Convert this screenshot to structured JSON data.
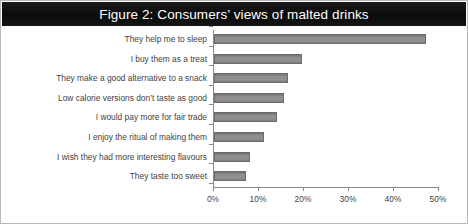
{
  "figure": {
    "title": "Figure 2: Consumers’ views of malted drinks",
    "border_color": "#b9b9b9",
    "title_band_color": "#101010",
    "title_text_color": "#ffffff"
  },
  "chart_data": {
    "type": "bar",
    "orientation": "horizontal",
    "title": "Figure 2: Consumers’ views of malted drinks",
    "xlabel": "",
    "ylabel": "",
    "xlim": [
      0,
      50
    ],
    "grid": false,
    "legend": false,
    "bar_color": "#878787",
    "bar_border_color": "#6b6b6b",
    "tick_label_format": "percent",
    "xticks": [
      0,
      10,
      20,
      30,
      40,
      50
    ],
    "xtick_labels": [
      "0%",
      "10%",
      "20%",
      "30%",
      "40%",
      "50%"
    ],
    "categories": [
      "They help me to sleep",
      "I buy them as a treat",
      "They make a good alternative to a snack",
      "Low calorie versions don’t taste as good",
      "I would pay more for fair trade",
      "I enjoy the ritual of making them",
      "I wish they had more interesting flavours",
      "They taste too sweet"
    ],
    "values": [
      47,
      19.5,
      16.5,
      15.5,
      14,
      11,
      8,
      7
    ]
  }
}
